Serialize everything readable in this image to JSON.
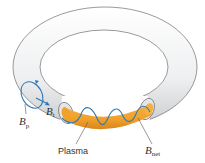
{
  "diagram": {
    "type": "tokamak-torus-magnetic-fields",
    "labels": {
      "poloidal_field": {
        "main": "B",
        "sub": "p"
      },
      "toroidal_field": {
        "main": "B",
        "sub": "t"
      },
      "plasma": "Plasma",
      "net_field": {
        "main": "B",
        "sub": "net"
      }
    },
    "colors": {
      "torus_fill": "#f2f2f3",
      "torus_shade": "#c9cbce",
      "torus_outline": "#6d6f72",
      "plasma": "#f0a12a",
      "plasma_dark": "#d9861a",
      "field_line": "#2f78b7",
      "leader_line": "#555555",
      "text": "#333333"
    }
  }
}
